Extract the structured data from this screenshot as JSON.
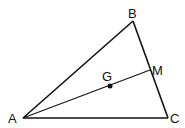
{
  "diagram": {
    "type": "triangle-median-centroid",
    "points": {
      "A": {
        "label": "A",
        "x": 23,
        "y": 118
      },
      "B": {
        "label": "B",
        "x": 133,
        "y": 21
      },
      "C": {
        "label": "C",
        "x": 168,
        "y": 118
      },
      "M": {
        "label": "M",
        "x": 150,
        "y": 70
      },
      "G": {
        "label": "G",
        "x": 110,
        "y": 86
      }
    },
    "segments": [
      [
        "A",
        "B"
      ],
      [
        "B",
        "C"
      ],
      [
        "C",
        "A"
      ],
      [
        "A",
        "M"
      ]
    ],
    "colors": {
      "stroke": "#111111",
      "background": "#ffffff"
    }
  }
}
